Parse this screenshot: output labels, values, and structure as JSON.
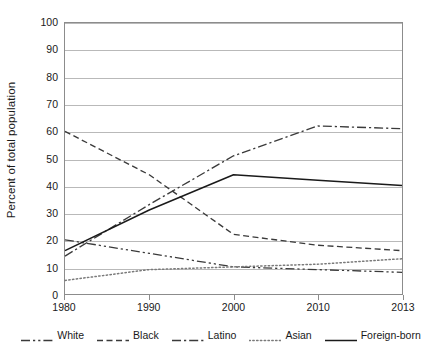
{
  "chart_data": {
    "type": "line",
    "title": "",
    "xlabel": "",
    "ylabel": "Percent of total population",
    "x": [
      1980,
      1990,
      2000,
      2010,
      2013
    ],
    "categories": [
      "1980",
      "1990",
      "2000",
      "2010",
      "2013"
    ],
    "ylim": [
      0,
      100
    ],
    "xlim": [
      1980,
      2013
    ],
    "y_ticks": [
      0,
      10,
      20,
      30,
      40,
      50,
      60,
      70,
      80,
      90,
      100
    ],
    "y_tick_labels": [
      "0",
      "10",
      "20",
      "30",
      "40",
      "50",
      "60",
      "70",
      "80",
      "90",
      "100"
    ],
    "grid": true,
    "legend_position": "bottom",
    "series": [
      {
        "name": "White",
        "values": [
          20,
          15,
          10,
          9,
          8
        ],
        "style": "dash-dot-dot",
        "color": "#3a3a3a"
      },
      {
        "name": "Black",
        "values": [
          60,
          44,
          22,
          18,
          16
        ],
        "style": "dashed",
        "color": "#3a3a3a"
      },
      {
        "name": "Latino",
        "values": [
          14,
          33,
          51,
          62,
          61
        ],
        "style": "dash-dot",
        "color": "#3a3a3a"
      },
      {
        "name": "Asian",
        "values": [
          5,
          9,
          10,
          11,
          13
        ],
        "style": "dotted",
        "color": "#7a7a7a"
      },
      {
        "name": "Foreign-born",
        "values": [
          16,
          31,
          44,
          42,
          40
        ],
        "style": "solid",
        "color": "#1a1a1a"
      }
    ]
  },
  "legend": {
    "items": [
      {
        "label": "White"
      },
      {
        "label": "Black"
      },
      {
        "label": "Latino"
      },
      {
        "label": "Asian"
      },
      {
        "label": "Foreign-born"
      }
    ]
  }
}
